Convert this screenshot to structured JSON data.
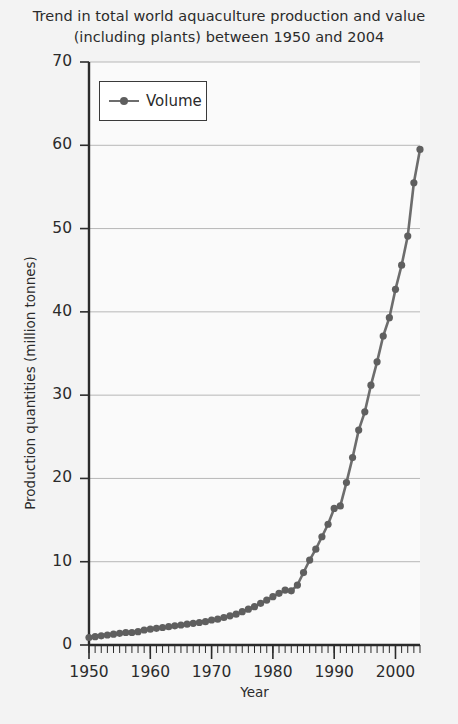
{
  "chart_data": {
    "type": "line",
    "title": "Trend in total world aquaculture production and value (including plants) between 1950 and 2004",
    "title_line1": "Trend in total world aquaculture production and value",
    "title_line2": "(including plants) between 1950 and 2004",
    "xlabel": "Year",
    "ylabel": "Production quantities (million tonnes)",
    "xlim": [
      1950,
      2004
    ],
    "ylim": [
      0,
      70
    ],
    "x_ticks": [
      1950,
      1960,
      1970,
      1980,
      1990,
      2000
    ],
    "x_tick_labels": [
      "1950",
      "1960",
      "1970",
      "1980",
      "1990",
      "2000"
    ],
    "x_minor_tick_step": 1,
    "y_ticks": [
      0,
      10,
      20,
      30,
      40,
      50,
      60,
      70
    ],
    "y_tick_labels": [
      "0",
      "10",
      "20",
      "30",
      "40",
      "50",
      "60",
      "70"
    ],
    "grid": "horizontal",
    "legend_position": "upper left",
    "series": [
      {
        "name": "Volume",
        "marker": "circle",
        "color": "#6d6d6d",
        "x": [
          1950,
          1951,
          1952,
          1953,
          1954,
          1955,
          1956,
          1957,
          1958,
          1959,
          1960,
          1961,
          1962,
          1963,
          1964,
          1965,
          1966,
          1967,
          1968,
          1969,
          1970,
          1971,
          1972,
          1973,
          1974,
          1975,
          1976,
          1977,
          1978,
          1979,
          1980,
          1981,
          1982,
          1983,
          1984,
          1985,
          1986,
          1987,
          1988,
          1989,
          1990,
          1991,
          1992,
          1993,
          1994,
          1995,
          1996,
          1997,
          1998,
          1999,
          2000,
          2001,
          2002,
          2003,
          2004
        ],
        "values": [
          0.9,
          1.0,
          1.1,
          1.2,
          1.3,
          1.4,
          1.5,
          1.5,
          1.6,
          1.8,
          1.9,
          2.0,
          2.1,
          2.2,
          2.3,
          2.4,
          2.5,
          2.6,
          2.7,
          2.8,
          3.0,
          3.1,
          3.3,
          3.5,
          3.7,
          4.0,
          4.3,
          4.6,
          5.0,
          5.4,
          5.8,
          6.2,
          6.6,
          6.5,
          7.2,
          8.7,
          10.2,
          11.5,
          13.0,
          14.5,
          16.4,
          16.7,
          19.5,
          22.5,
          25.8,
          28.0,
          31.2,
          34.0,
          37.1,
          39.3,
          42.7,
          45.6,
          49.1,
          55.5,
          59.5
        ]
      }
    ]
  },
  "legend": {
    "items": [
      {
        "label": "Volume"
      }
    ]
  }
}
